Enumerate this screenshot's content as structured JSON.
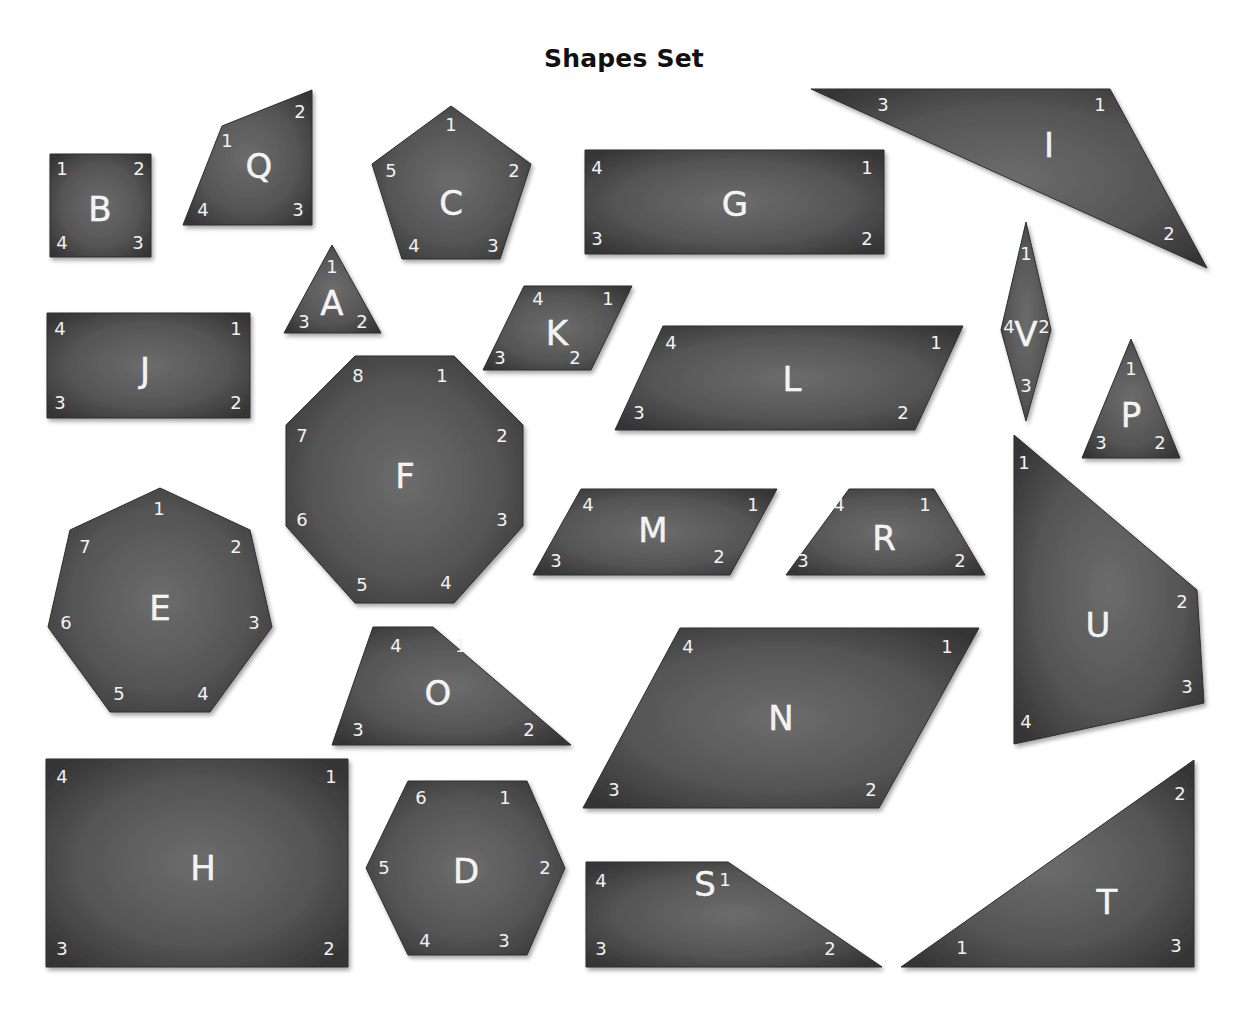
{
  "title": "Shapes Set",
  "colors": {
    "shape_fill_center": "#6a6a6a",
    "shape_fill_edge": "#3a3a3a",
    "label": "#f2f2f2",
    "background": "#ffffff"
  },
  "shapes": [
    {
      "id": "B",
      "points": [
        [
          50,
          154
        ],
        [
          151,
          154
        ],
        [
          151,
          257
        ],
        [
          50,
          257
        ]
      ],
      "letter_pos": [
        100,
        209
      ],
      "vertices": [
        {
          "n": "1",
          "x": 62,
          "y": 168
        },
        {
          "n": "2",
          "x": 139,
          "y": 168
        },
        {
          "n": "3",
          "x": 138,
          "y": 242
        },
        {
          "n": "4",
          "x": 62,
          "y": 242
        }
      ]
    },
    {
      "id": "Q",
      "points": [
        [
          222,
          126
        ],
        [
          312,
          90
        ],
        [
          312,
          225
        ],
        [
          183,
          225
        ]
      ],
      "letter_pos": [
        259,
        166
      ],
      "vertices": [
        {
          "n": "1",
          "x": 227,
          "y": 140
        },
        {
          "n": "2",
          "x": 300,
          "y": 111
        },
        {
          "n": "3",
          "x": 298,
          "y": 209
        },
        {
          "n": "4",
          "x": 203,
          "y": 209
        }
      ]
    },
    {
      "id": "C",
      "points": [
        [
          451,
          106
        ],
        [
          531,
          164
        ],
        [
          500,
          259
        ],
        [
          402,
          259
        ],
        [
          372,
          164
        ]
      ],
      "letter_pos": [
        451,
        203
      ],
      "vertices": [
        {
          "n": "1",
          "x": 451,
          "y": 124
        },
        {
          "n": "2",
          "x": 514,
          "y": 170
        },
        {
          "n": "3",
          "x": 493,
          "y": 245
        },
        {
          "n": "4",
          "x": 414,
          "y": 245
        },
        {
          "n": "5",
          "x": 391,
          "y": 170
        }
      ]
    },
    {
      "id": "G",
      "points": [
        [
          585,
          150
        ],
        [
          884,
          150
        ],
        [
          884,
          254
        ],
        [
          585,
          254
        ]
      ],
      "letter_pos": [
        735,
        204
      ],
      "vertices": [
        {
          "n": "1",
          "x": 867,
          "y": 167
        },
        {
          "n": "2",
          "x": 867,
          "y": 238
        },
        {
          "n": "3",
          "x": 597,
          "y": 238
        },
        {
          "n": "4",
          "x": 597,
          "y": 167
        }
      ]
    },
    {
      "id": "I",
      "points": [
        [
          811,
          89
        ],
        [
          1110,
          89
        ],
        [
          1207,
          268
        ]
      ],
      "letter_pos": [
        1049,
        145
      ],
      "vertices": [
        {
          "n": "1",
          "x": 1100,
          "y": 104
        },
        {
          "n": "2",
          "x": 1169,
          "y": 233
        },
        {
          "n": "3",
          "x": 883,
          "y": 104
        }
      ]
    },
    {
      "id": "A",
      "points": [
        [
          332,
          245
        ],
        [
          381,
          333
        ],
        [
          284,
          333
        ]
      ],
      "letter_pos": [
        332,
        303
      ],
      "vertices": [
        {
          "n": "1",
          "x": 332,
          "y": 266
        },
        {
          "n": "2",
          "x": 362,
          "y": 321
        },
        {
          "n": "3",
          "x": 304,
          "y": 321
        }
      ]
    },
    {
      "id": "K",
      "points": [
        [
          524,
          286
        ],
        [
          632,
          286
        ],
        [
          591,
          370
        ],
        [
          483,
          370
        ]
      ],
      "letter_pos": [
        557,
        333
      ],
      "vertices": [
        {
          "n": "1",
          "x": 608,
          "y": 298
        },
        {
          "n": "2",
          "x": 575,
          "y": 357
        },
        {
          "n": "3",
          "x": 500,
          "y": 357
        },
        {
          "n": "4",
          "x": 538,
          "y": 298
        }
      ]
    },
    {
      "id": "J",
      "points": [
        [
          47,
          313
        ],
        [
          250,
          313
        ],
        [
          250,
          418
        ],
        [
          47,
          418
        ]
      ],
      "letter_pos": [
        145,
        370
      ],
      "vertices": [
        {
          "n": "1",
          "x": 236,
          "y": 328
        },
        {
          "n": "2",
          "x": 236,
          "y": 402
        },
        {
          "n": "3",
          "x": 60,
          "y": 402
        },
        {
          "n": "4",
          "x": 60,
          "y": 328
        }
      ]
    },
    {
      "id": "L",
      "points": [
        [
          663,
          326
        ],
        [
          963,
          326
        ],
        [
          915,
          430
        ],
        [
          615,
          430
        ]
      ],
      "letter_pos": [
        792,
        379
      ],
      "vertices": [
        {
          "n": "1",
          "x": 936,
          "y": 342
        },
        {
          "n": "2",
          "x": 903,
          "y": 412
        },
        {
          "n": "3",
          "x": 639,
          "y": 412
        },
        {
          "n": "4",
          "x": 671,
          "y": 342
        }
      ]
    },
    {
      "id": "V",
      "points": [
        [
          1026,
          222
        ],
        [
          1051,
          330
        ],
        [
          1026,
          421
        ],
        [
          1001,
          330
        ]
      ],
      "letter_pos": [
        1026,
        334
      ],
      "vertices": [
        {
          "n": "1",
          "x": 1026,
          "y": 253
        },
        {
          "n": "2",
          "x": 1044,
          "y": 326
        },
        {
          "n": "3",
          "x": 1026,
          "y": 385
        },
        {
          "n": "4",
          "x": 1009,
          "y": 326
        }
      ]
    },
    {
      "id": "P",
      "points": [
        [
          1131,
          339
        ],
        [
          1180,
          458
        ],
        [
          1082,
          458
        ]
      ],
      "letter_pos": [
        1131,
        415
      ],
      "vertices": [
        {
          "n": "1",
          "x": 1131,
          "y": 368
        },
        {
          "n": "2",
          "x": 1160,
          "y": 442
        },
        {
          "n": "3",
          "x": 1101,
          "y": 442
        }
      ]
    },
    {
      "id": "F",
      "points": [
        [
          355,
          356
        ],
        [
          454,
          356
        ],
        [
          523,
          425
        ],
        [
          523,
          526
        ],
        [
          454,
          603
        ],
        [
          355,
          603
        ],
        [
          286,
          526
        ],
        [
          286,
          425
        ]
      ],
      "letter_pos": [
        405,
        476
      ],
      "vertices": [
        {
          "n": "1",
          "x": 442,
          "y": 375
        },
        {
          "n": "2",
          "x": 502,
          "y": 435
        },
        {
          "n": "3",
          "x": 502,
          "y": 519
        },
        {
          "n": "4",
          "x": 446,
          "y": 582
        },
        {
          "n": "5",
          "x": 362,
          "y": 584
        },
        {
          "n": "6",
          "x": 302,
          "y": 519
        },
        {
          "n": "7",
          "x": 302,
          "y": 435
        },
        {
          "n": "8",
          "x": 358,
          "y": 375
        }
      ]
    },
    {
      "id": "E",
      "points": [
        [
          160,
          488
        ],
        [
          250,
          530
        ],
        [
          272,
          627
        ],
        [
          210,
          712
        ],
        [
          110,
          712
        ],
        [
          48,
          627
        ],
        [
          70,
          530
        ]
      ],
      "letter_pos": [
        160,
        608
      ],
      "vertices": [
        {
          "n": "1",
          "x": 159,
          "y": 508
        },
        {
          "n": "2",
          "x": 236,
          "y": 546
        },
        {
          "n": "3",
          "x": 254,
          "y": 622
        },
        {
          "n": "4",
          "x": 203,
          "y": 693
        },
        {
          "n": "5",
          "x": 119,
          "y": 693
        },
        {
          "n": "6",
          "x": 66,
          "y": 622
        },
        {
          "n": "7",
          "x": 85,
          "y": 546
        }
      ]
    },
    {
      "id": "M",
      "points": [
        [
          581,
          489
        ],
        [
          777,
          489
        ],
        [
          730,
          575
        ],
        [
          533,
          575
        ]
      ],
      "letter_pos": [
        653,
        530
      ],
      "vertices": [
        {
          "n": "1",
          "x": 753,
          "y": 504
        },
        {
          "n": "2",
          "x": 719,
          "y": 556
        },
        {
          "n": "3",
          "x": 556,
          "y": 560
        },
        {
          "n": "4",
          "x": 588,
          "y": 504
        }
      ]
    },
    {
      "id": "R",
      "points": [
        [
          849,
          489
        ],
        [
          934,
          489
        ],
        [
          985,
          575
        ],
        [
          786,
          575
        ]
      ],
      "letter_pos": [
        884,
        538
      ],
      "vertices": [
        {
          "n": "1",
          "x": 925,
          "y": 504
        },
        {
          "n": "2",
          "x": 960,
          "y": 560
        },
        {
          "n": "3",
          "x": 803,
          "y": 560
        },
        {
          "n": "4",
          "x": 839,
          "y": 504
        }
      ]
    },
    {
      "id": "U",
      "points": [
        [
          1014,
          435
        ],
        [
          1197,
          590
        ],
        [
          1204,
          703
        ],
        [
          1014,
          744
        ]
      ],
      "letter_pos": [
        1098,
        625
      ],
      "vertices": [
        {
          "n": "1",
          "x": 1024,
          "y": 462
        },
        {
          "n": "2",
          "x": 1182,
          "y": 601
        },
        {
          "n": "3",
          "x": 1187,
          "y": 686
        },
        {
          "n": "4",
          "x": 1026,
          "y": 721
        }
      ]
    },
    {
      "id": "O",
      "points": [
        [
          373,
          627
        ],
        [
          433,
          627
        ],
        [
          571,
          745
        ],
        [
          332,
          745
        ]
      ],
      "letter_pos": [
        438,
        693
      ],
      "vertices": [
        {
          "n": "1",
          "x": 461,
          "y": 645
        },
        {
          "n": "2",
          "x": 529,
          "y": 729
        },
        {
          "n": "3",
          "x": 358,
          "y": 729
        },
        {
          "n": "4",
          "x": 396,
          "y": 645
        }
      ]
    },
    {
      "id": "N",
      "points": [
        [
          680,
          628
        ],
        [
          979,
          628
        ],
        [
          879,
          808
        ],
        [
          583,
          808
        ]
      ],
      "letter_pos": [
        781,
        718
      ],
      "vertices": [
        {
          "n": "1",
          "x": 947,
          "y": 646
        },
        {
          "n": "2",
          "x": 871,
          "y": 789
        },
        {
          "n": "3",
          "x": 614,
          "y": 789
        },
        {
          "n": "4",
          "x": 688,
          "y": 646
        }
      ]
    },
    {
      "id": "H",
      "points": [
        [
          46,
          759
        ],
        [
          348,
          759
        ],
        [
          348,
          967
        ],
        [
          46,
          967
        ]
      ],
      "letter_pos": [
        203,
        868
      ],
      "vertices": [
        {
          "n": "1",
          "x": 331,
          "y": 776
        },
        {
          "n": "2",
          "x": 329,
          "y": 948
        },
        {
          "n": "3",
          "x": 62,
          "y": 948
        },
        {
          "n": "4",
          "x": 62,
          "y": 776
        }
      ]
    },
    {
      "id": "D",
      "points": [
        [
          408,
          781
        ],
        [
          527,
          781
        ],
        [
          565,
          868
        ],
        [
          527,
          955
        ],
        [
          408,
          955
        ],
        [
          366,
          868
        ]
      ],
      "letter_pos": [
        466,
        871
      ],
      "vertices": [
        {
          "n": "1",
          "x": 505,
          "y": 797
        },
        {
          "n": "2",
          "x": 545,
          "y": 867
        },
        {
          "n": "3",
          "x": 504,
          "y": 940
        },
        {
          "n": "4",
          "x": 425,
          "y": 940
        },
        {
          "n": "5",
          "x": 384,
          "y": 867
        },
        {
          "n": "6",
          "x": 421,
          "y": 797
        }
      ]
    },
    {
      "id": "S",
      "points": [
        [
          586,
          862
        ],
        [
          728,
          862
        ],
        [
          882,
          967
        ],
        [
          586,
          967
        ]
      ],
      "letter_pos": [
        705,
        884
      ],
      "vertices": [
        {
          "n": "1",
          "x": 725,
          "y": 879
        },
        {
          "n": "2",
          "x": 830,
          "y": 948
        },
        {
          "n": "3",
          "x": 601,
          "y": 948
        },
        {
          "n": "4",
          "x": 601,
          "y": 880
        }
      ]
    },
    {
      "id": "T",
      "points": [
        [
          1194,
          760
        ],
        [
          1194,
          967
        ],
        [
          901,
          967
        ]
      ],
      "letter_pos": [
        1107,
        902
      ],
      "vertices": [
        {
          "n": "1",
          "x": 962,
          "y": 947
        },
        {
          "n": "2",
          "x": 1180,
          "y": 793
        },
        {
          "n": "3",
          "x": 1176,
          "y": 945
        }
      ]
    }
  ]
}
